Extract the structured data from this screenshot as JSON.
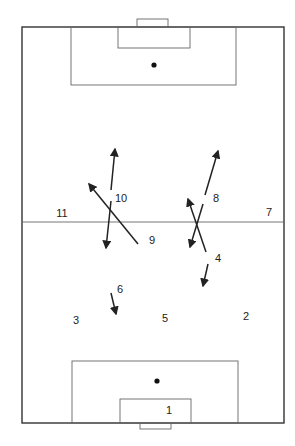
{
  "diagram": {
    "type": "soccer-pitch-tactics",
    "colors": {
      "background": "#ffffff",
      "lines": "#333333",
      "arrows": "#222222"
    },
    "pitch": {
      "boundary": {
        "x1": 22,
        "y1": 27,
        "x2": 284,
        "y2": 423
      },
      "halfway_line_y": 222,
      "top": {
        "goal": {
          "x1": 137,
          "y1": 19,
          "x2": 168,
          "y2": 27
        },
        "goal_area": {
          "x1": 118,
          "y1": 27,
          "x2": 190,
          "y2": 48
        },
        "penalty_area": {
          "x1": 71,
          "y1": 27,
          "x2": 236,
          "y2": 85
        },
        "penalty_spot": {
          "x": 154,
          "y": 65
        }
      },
      "bottom": {
        "goal": {
          "x1": 140,
          "y1": 423,
          "x2": 171,
          "y2": 429
        },
        "goal_area": {
          "x1": 120,
          "y1": 399,
          "x2": 191,
          "y2": 423
        },
        "penalty_area": {
          "x1": 72,
          "y1": 361,
          "x2": 238,
          "y2": 423
        },
        "penalty_spot": {
          "x": 157,
          "y": 381
        }
      }
    },
    "players": [
      {
        "number": "1",
        "x": 169,
        "y": 414
      },
      {
        "number": "2",
        "x": 246,
        "y": 320
      },
      {
        "number": "3",
        "x": 76,
        "y": 324
      },
      {
        "number": "4",
        "x": 218,
        "y": 262
      },
      {
        "number": "5",
        "x": 165,
        "y": 322
      },
      {
        "number": "6",
        "x": 120,
        "y": 293
      },
      {
        "number": "7",
        "x": 269,
        "y": 216
      },
      {
        "number": "8",
        "x": 216,
        "y": 202
      },
      {
        "number": "9",
        "x": 152,
        "y": 244
      },
      {
        "number": "10",
        "x": 121,
        "y": 202
      },
      {
        "number": "11",
        "x": 62,
        "y": 217
      }
    ],
    "runs": [
      {
        "player": "10",
        "direction": "forward",
        "from": {
          "x": 111,
          "y": 190
        },
        "to": {
          "x": 115,
          "y": 149
        }
      },
      {
        "player": "10",
        "direction": "back",
        "from": {
          "x": 111,
          "y": 201
        },
        "to": {
          "x": 106,
          "y": 248
        }
      },
      {
        "player": "9",
        "direction": "diagonal-forward-left",
        "from": {
          "x": 138,
          "y": 244
        },
        "to": {
          "x": 89,
          "y": 184
        }
      },
      {
        "player": "8",
        "direction": "forward",
        "from": {
          "x": 205,
          "y": 195
        },
        "to": {
          "x": 218,
          "y": 151
        }
      },
      {
        "player": "8",
        "direction": "back",
        "from": {
          "x": 203,
          "y": 204
        },
        "to": {
          "x": 190,
          "y": 247
        }
      },
      {
        "player": "4",
        "direction": "forward",
        "from": {
          "x": 206,
          "y": 252
        },
        "to": {
          "x": 188,
          "y": 199
        }
      },
      {
        "player": "4",
        "direction": "back",
        "from": {
          "x": 208,
          "y": 264
        },
        "to": {
          "x": 203,
          "y": 286
        }
      },
      {
        "player": "6",
        "direction": "back",
        "from": {
          "x": 111,
          "y": 293
        },
        "to": {
          "x": 116,
          "y": 314
        }
      }
    ]
  }
}
